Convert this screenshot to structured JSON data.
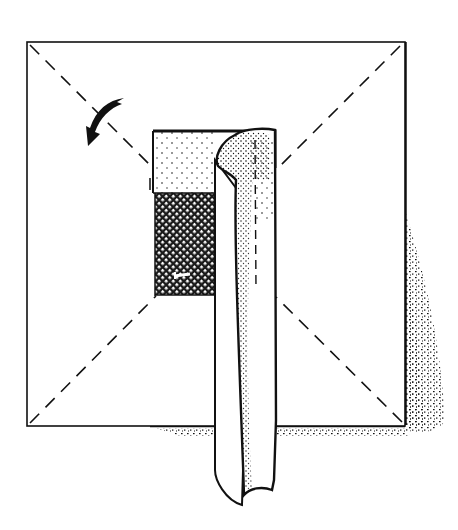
{
  "diagram": {
    "type": "folding-diagram",
    "colors": {
      "line": "#111111",
      "paper": "#ffffff",
      "shade": "#1a1a1a"
    },
    "elements": {
      "sheet": "square-sheet",
      "fold_lines": [
        "diagonal-top-left",
        "diagonal-top-right",
        "diagonal-bottom-left",
        "diagonal-bottom-right",
        "strip-center-fold"
      ],
      "flap": [
        "dotted-upper-panel",
        "crosshatched-lower-panel"
      ],
      "strip": "curled-hanging-strip",
      "arrow": "curved-fold-arrow"
    }
  }
}
